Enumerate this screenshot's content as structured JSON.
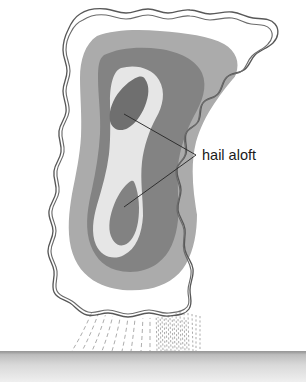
{
  "figure": {
    "name": "hailstorm-cross-section",
    "title": "",
    "background_color": "#ffffff",
    "width": 306,
    "height": 388
  },
  "annotations": [
    {
      "id": "hail-aloft",
      "label": "hail aloft",
      "text_x": 202,
      "text_y": 160,
      "leader_origin": {
        "x": 196,
        "y": 155
      },
      "targets": [
        {
          "name": "upper-hail-core",
          "x": 124,
          "y": 114
        },
        {
          "name": "lower-hail-core",
          "x": 124,
          "y": 207
        }
      ]
    }
  ],
  "regions": [
    {
      "name": "cloud-outline",
      "description": "wavy double-line cumulonimbus boundary",
      "stroke_color": "#585858",
      "fill_color": "#ffffff"
    },
    {
      "name": "reflectivity-band-light",
      "description": "outer light-gray echo region",
      "color": "#ababab"
    },
    {
      "name": "reflectivity-band-medium",
      "description": "inner medium-gray echo region",
      "color": "#838383"
    },
    {
      "name": "reflectivity-core-pale",
      "description": "pale high-reflectivity column",
      "color": "#e6e6e6"
    },
    {
      "name": "upper-hail-core",
      "description": "upper dark hail embryo teardrop",
      "color": "#6f6f6f"
    },
    {
      "name": "lower-hail-core",
      "description": "lower dark hail teardrop",
      "color": "#828282"
    }
  ],
  "precipitation": {
    "name": "precipitation-shaft",
    "description": "dashed streaks falling from cloud base to ground",
    "stroke_color": "#9a9a9a",
    "left_group_count": 9,
    "right_group_count": 20
  },
  "ground": {
    "name": "ground-surface",
    "label": "",
    "top_y": 351,
    "bottom_y": 382,
    "top_color": "#8f8f8f",
    "bottom_color": "#e9e9e9"
  },
  "colors": {
    "light_gray": "#ababab",
    "medium_gray": "#838383",
    "dark_gray": "#6f6f6f",
    "pale_gray": "#e6e6e6",
    "outline": "#585858",
    "leader_line": "#2a2a2a",
    "text": "#1a1a1a"
  }
}
